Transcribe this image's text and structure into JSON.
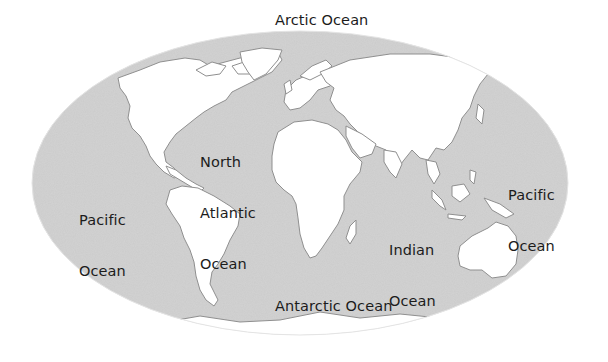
{
  "map": {
    "type": "world-map",
    "projection": "elliptical (Mollweide-like)",
    "colors": {
      "ocean": "#cbcbcb",
      "land": "#ffffff",
      "coast": "#8a8a8a",
      "text": "#1c1c1c",
      "background": "#ffffff"
    },
    "labels": {
      "arctic": "Arctic Ocean",
      "north_atlantic_1": "North",
      "north_atlantic_2": "Atlantic",
      "north_atlantic_3": "Ocean",
      "pacific_west_1": "Pacific",
      "pacific_west_2": "Ocean",
      "pacific_east_1": "Pacific",
      "pacific_east_2": "Ocean",
      "indian_1": "Indian",
      "indian_2": "Ocean",
      "antarctic": "Antarctic Ocean"
    }
  }
}
